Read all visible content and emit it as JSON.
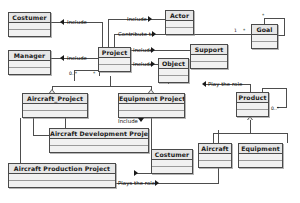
{
  "diagram": {
    "type": "uml-class-diagram",
    "background_color": "#ffffff",
    "box_fill_color": "#ededed",
    "line_color": "#4d4d4d"
  },
  "classes": [
    {
      "id": "costumer_top",
      "name": "Costumer"
    },
    {
      "id": "manager",
      "name": "Manager"
    },
    {
      "id": "project",
      "name": "Project"
    },
    {
      "id": "actor",
      "name": "Actor"
    },
    {
      "id": "goal",
      "name": "Goal"
    },
    {
      "id": "support",
      "name": "Support"
    },
    {
      "id": "object",
      "name": "Object"
    },
    {
      "id": "aircraft_project",
      "name": "Aircraft_Project"
    },
    {
      "id": "equipment_project",
      "name": "Equipment Project"
    },
    {
      "id": "product",
      "name": "Product"
    },
    {
      "id": "acft_dev",
      "name": "Aircraft Development Project"
    },
    {
      "id": "costumer_bottom",
      "name": "Costumer"
    },
    {
      "id": "aircraft",
      "name": "Aircraft"
    },
    {
      "id": "equipment",
      "name": "Equipment"
    },
    {
      "id": "acft_prod",
      "name": "Aircraft Production Project"
    }
  ],
  "relationship_labels": {
    "include_costumer": "Include",
    "include_manager": "Include",
    "include_actor": "Include",
    "contribute_to": "Contribute to",
    "include_support": "Include",
    "include_object": "Include",
    "play_the_role": "Play the role",
    "include_costumer_bottom": "Include",
    "plays_the_role": "Plays the role"
  },
  "multiplicities": {
    "goal_self_top": "*",
    "goal_left_one": "1",
    "goal_left_star": "*",
    "product_self": "0..*",
    "project_self_left": "0..*",
    "project_self_right": "*"
  }
}
